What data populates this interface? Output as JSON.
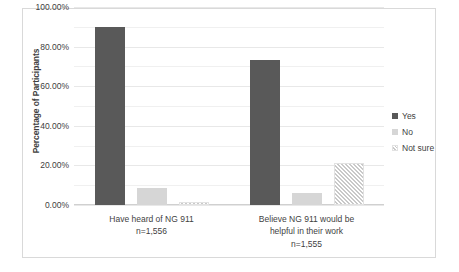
{
  "chart_data": {
    "type": "bar",
    "title": "",
    "xlabel": "",
    "ylabel": "Percentage of Participants",
    "ylim": [
      0,
      100
    ],
    "ytick_labels": [
      "0.00%",
      "20.00%",
      "40.00%",
      "60.00%",
      "80.00%",
      "100.00%"
    ],
    "ytick_values": [
      0,
      20,
      40,
      60,
      80,
      100
    ],
    "grid": true,
    "legend_position": "right",
    "categories": [
      "Have heard of NG 911\nn=1,556",
      "Believe NG 911 would be helpful in their work\nn=1,555"
    ],
    "category_blocks": [
      {
        "lines": [
          "Have heard of NG 911",
          "n=1,556"
        ]
      },
      {
        "lines": [
          "Believe NG 911 would be",
          "helpful in their work",
          "n=1,555"
        ]
      }
    ],
    "series": [
      {
        "name": "Yes",
        "color": "#595959",
        "values": [
          90.0,
          73.0
        ]
      },
      {
        "name": "No",
        "color": "#d6d6d6",
        "values": [
          8.5,
          6.0
        ]
      },
      {
        "name": "Not sure",
        "color": "#c9c9c9",
        "values": [
          1.5,
          21.0
        ]
      }
    ]
  },
  "legend": {
    "items": [
      {
        "label": "Yes"
      },
      {
        "label": "No"
      },
      {
        "label": "Not sure"
      }
    ]
  },
  "axis": {
    "y_title": "Percentage of Participants"
  }
}
